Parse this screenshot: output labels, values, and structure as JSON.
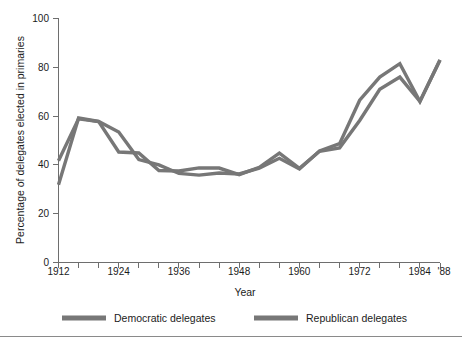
{
  "chart_data": {
    "type": "line",
    "title": "",
    "xlabel": "Year",
    "ylabel": "Percentage of delegates elected in primaries",
    "xlim": [
      1912,
      1988
    ],
    "ylim": [
      0,
      100
    ],
    "grid": false,
    "legend_position": "bottom",
    "x": [
      1912,
      1916,
      1920,
      1924,
      1928,
      1932,
      1936,
      1940,
      1944,
      1948,
      1952,
      1956,
      1960,
      1964,
      1968,
      1972,
      1976,
      1980,
      1984,
      1988
    ],
    "x_tick_labels": [
      "1912",
      "1924",
      "1936",
      "1948",
      "1960",
      "1972",
      "1984",
      "'88"
    ],
    "x_tick_values": [
      1912,
      1924,
      1936,
      1948,
      1960,
      1972,
      1984,
      1988
    ],
    "y_tick_labels": [
      "0",
      "20",
      "40",
      "60",
      "80",
      "100"
    ],
    "y_tick_values": [
      0,
      20,
      40,
      60,
      80,
      100
    ],
    "series": [
      {
        "name": "Democratic delegates",
        "color": "#777777",
        "values": [
          44.6,
          59.2,
          57.8,
          53.5,
          42.2,
          40.0,
          36.5,
          35.8,
          36.7,
          36.3,
          38.7,
          42.7,
          38.3,
          45.7,
          48.7,
          66.5,
          76.0,
          81.5,
          66.0,
          83.0
        ]
      },
      {
        "name": "Republican delegates",
        "color": "#777777",
        "values": [
          41.7,
          58.9,
          57.8,
          45.3,
          44.9,
          37.7,
          37.5,
          38.8,
          38.7,
          36.0,
          39.0,
          44.8,
          38.6,
          45.6,
          47.0,
          58.2,
          71.0,
          76.0,
          66.0,
          83.0
        ]
      }
    ],
    "series_secondary_start": [
      31.9,
      41.7
    ]
  },
  "legend": {
    "items": [
      {
        "label": "Democratic delegates"
      },
      {
        "label": "Republican delegates"
      }
    ]
  },
  "axes": {
    "x_title": "Year",
    "y_title": "Percentage of delegates elected in primaries"
  }
}
